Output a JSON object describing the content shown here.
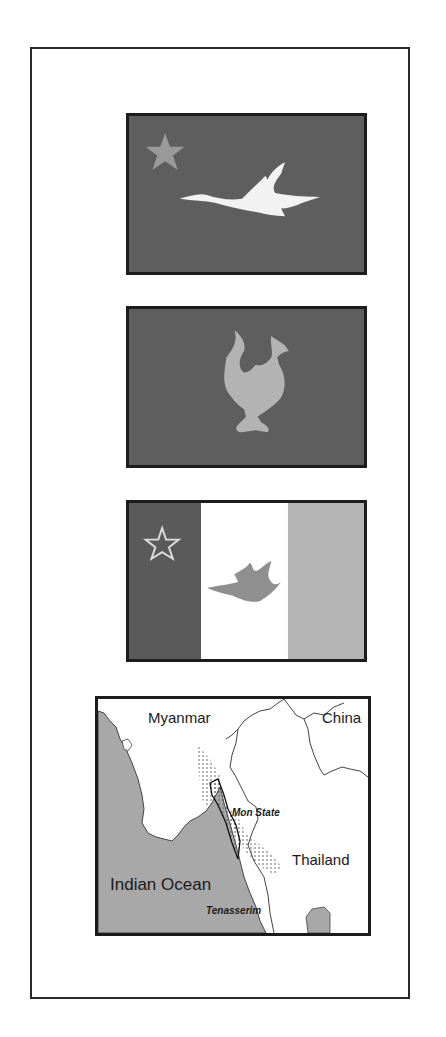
{
  "colors": {
    "frame_border": "#2a2a2a",
    "flag_border": "#1c1c1c",
    "flag_dark": "#5e5e5e",
    "star": "#9a9a9a",
    "swan": "#f2f2f2",
    "hamsa": "#b3b3b3",
    "stripe_dark": "#5a5a5a",
    "stripe_white": "#ffffff",
    "stripe_light": "#b4b4b4",
    "ocean": "#a8a8a8",
    "land": "#ffffff"
  },
  "flags": [
    {
      "name": "flag-star-swan",
      "description": "Dark field, gray star at upper left, white flying swan"
    },
    {
      "name": "flag-hamsa",
      "description": "Dark field, light gray hamsa (sheldrake) bird"
    },
    {
      "name": "flag-tricolor",
      "description": "Vertical stripes dark/white/light, outlined star, gray flying bird"
    }
  ],
  "map": {
    "labels": {
      "myanmar": "Myanmar",
      "china": "China",
      "thailand": "Thailand",
      "indian_ocean": "Indian Ocean",
      "mon_state": "Mon State",
      "tenasserim": "Tenasserim"
    }
  }
}
